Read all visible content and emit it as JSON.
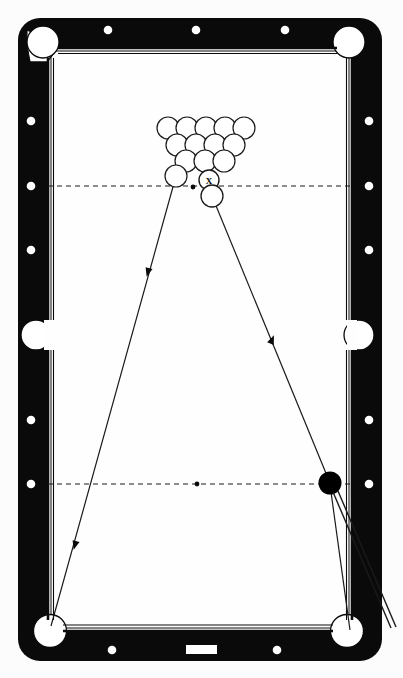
{
  "diagram": {
    "type": "billiards-shot-diagram",
    "colors": {
      "rail": "#0a0a0a",
      "cloth": "#fefefe",
      "pocket": "#ffffff",
      "line": "#1a1a1a",
      "cue_ball": "#000000",
      "object_ball_fill": "#ffffff",
      "background": "#fcfcfc"
    },
    "table": {
      "outer_rect": {
        "x": 18,
        "y": 18,
        "w": 364,
        "h": 643,
        "radius": 22
      },
      "inner_rect": {
        "x": 47,
        "y": 47,
        "w": 306,
        "h": 585
      },
      "rail_thickness": 29,
      "name_plate": {
        "x": 186,
        "y": 645,
        "w": 30,
        "h": 9,
        "label": ""
      }
    },
    "pockets": [
      {
        "name": "top-left-corner",
        "cx": 43,
        "cy": 41,
        "r": 16
      },
      {
        "name": "top-right-corner",
        "cx": 349,
        "cy": 41,
        "r": 16
      },
      {
        "name": "left-side",
        "cx": 34,
        "cy": 335,
        "r": 15
      },
      {
        "name": "right-side",
        "cx": 360,
        "cy": 335,
        "r": 15
      },
      {
        "name": "bottom-left-corner",
        "cx": 50,
        "cy": 632,
        "r": 16
      },
      {
        "name": "bottom-right-corner",
        "cx": 347,
        "cy": 632,
        "r": 16
      }
    ],
    "rail_sights": [
      {
        "cx": 108,
        "cy": 30
      },
      {
        "cx": 196,
        "cy": 30
      },
      {
        "cx": 285,
        "cy": 30
      },
      {
        "cx": 112,
        "cy": 650
      },
      {
        "cx": 277,
        "cy": 650
      },
      {
        "cx": 31,
        "cy": 121
      },
      {
        "cx": 31,
        "cy": 186
      },
      {
        "cx": 31,
        "cy": 250
      },
      {
        "cx": 31,
        "cy": 420
      },
      {
        "cx": 31,
        "cy": 484
      },
      {
        "cx": 369,
        "cy": 121
      },
      {
        "cx": 369,
        "cy": 186
      },
      {
        "cx": 369,
        "cy": 250
      },
      {
        "cx": 369,
        "cy": 420
      },
      {
        "cx": 369,
        "cy": 484
      }
    ],
    "string_lines": [
      {
        "name": "head-string",
        "y": 186,
        "x1": 47,
        "x2": 353
      },
      {
        "name": "foot-string",
        "y": 484,
        "x1": 47,
        "x2": 353
      }
    ],
    "spots": [
      {
        "name": "foot-spot",
        "cx": 193,
        "cy": 187,
        "r": 2.2
      },
      {
        "name": "center-spot",
        "cx": 197,
        "cy": 484,
        "r": 2.2
      }
    ],
    "rack": {
      "ball_radius": 11,
      "rows": [
        {
          "row": 1,
          "balls": [
            {
              "cx": 168,
              "cy": 128
            },
            {
              "cx": 187,
              "cy": 128
            },
            {
              "cx": 206,
              "cy": 128
            },
            {
              "cx": 225,
              "cy": 128
            },
            {
              "cx": 244,
              "cy": 128
            }
          ]
        },
        {
          "row": 2,
          "balls": [
            {
              "cx": 177,
              "cy": 145
            },
            {
              "cx": 196,
              "cy": 145
            },
            {
              "cx": 215,
              "cy": 145
            },
            {
              "cx": 234,
              "cy": 145
            }
          ]
        },
        {
          "row": 3,
          "balls": [
            {
              "cx": 186,
              "cy": 161
            },
            {
              "cx": 205,
              "cy": 161
            },
            {
              "cx": 224,
              "cy": 161
            }
          ]
        },
        {
          "row": 4,
          "balls": [
            {
              "cx": 176,
              "cy": 175
            }
          ]
        }
      ]
    },
    "marked_ball": {
      "name": "target-ball-x",
      "cx": 209,
      "cy": 180,
      "r": 10,
      "label": "X"
    },
    "loose_ball": {
      "name": "object-ball",
      "cx": 212,
      "cy": 196,
      "r": 11
    },
    "cue_ball": {
      "name": "cue-ball",
      "cx": 330,
      "cy": 483,
      "r": 11,
      "fill": "#000000"
    },
    "cue_stick": {
      "name": "cue-stick",
      "tip": {
        "x": 333,
        "y": 493
      },
      "butt": {
        "x": 390,
        "y": 628
      },
      "width": 4
    },
    "trajectories": [
      {
        "name": "left-path",
        "points": [
          {
            "x": 193,
            "y": 168
          },
          {
            "x": 176,
            "y": 175
          },
          {
            "x": 51,
            "y": 626
          }
        ],
        "arrows": [
          {
            "x": 148,
            "y": 272,
            "angle": 104
          },
          {
            "x": 75,
            "y": 545,
            "angle": 104
          }
        ]
      },
      {
        "name": "right-path",
        "points": [
          {
            "x": 212,
            "y": 196
          },
          {
            "x": 330,
            "y": 483
          }
        ],
        "arrows": [
          {
            "x": 272,
            "y": 340,
            "angle": -67
          }
        ]
      },
      {
        "name": "contact-line",
        "points": [
          {
            "x": 176,
            "y": 175
          },
          {
            "x": 205,
            "y": 161
          },
          {
            "x": 212,
            "y": 172
          }
        ]
      },
      {
        "name": "cue-ball-return",
        "points": [
          {
            "x": 330,
            "y": 483
          },
          {
            "x": 350,
            "y": 632
          }
        ]
      }
    ]
  }
}
